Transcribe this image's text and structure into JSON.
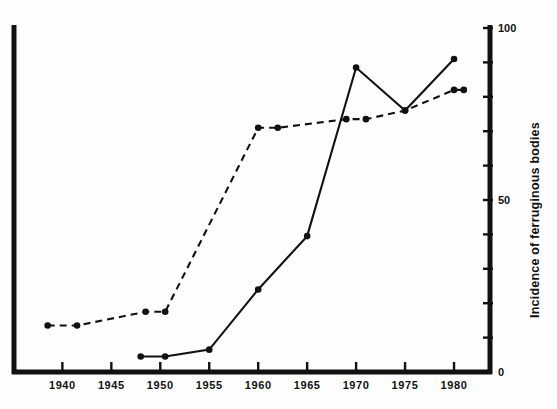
{
  "chart_data": {
    "type": "line",
    "title": "",
    "xlabel": "",
    "ylabel": "Incidence of ferruginous bodies",
    "xlim": [
      1936,
      1982
    ],
    "ylim": [
      0,
      100
    ],
    "xticks": [
      1940,
      1945,
      1950,
      1955,
      1960,
      1965,
      1970,
      1975,
      1980
    ],
    "xtick_labels": [
      "1940",
      "1945",
      "1950",
      "1955",
      "1960",
      "1965",
      "1970",
      "1975",
      "1980"
    ],
    "yticks": [
      0,
      10,
      20,
      30,
      40,
      50,
      60,
      70,
      80,
      90,
      100
    ],
    "ytick_labels_shown": {
      "100": "100",
      "50": "50",
      "0": "0"
    },
    "grid": false,
    "legend": "none",
    "y_axis_position": "right",
    "series": [
      {
        "name": "dashed-series",
        "style": "dashed",
        "marker": "filled-circle",
        "x": [
          1938.5,
          1941.5,
          1948.5,
          1950.5,
          1960,
          1962,
          1969,
          1971,
          1975,
          1980,
          1981
        ],
        "y": [
          13.5,
          13.5,
          17.5,
          17.5,
          71,
          71,
          73.5,
          73.5,
          76,
          82,
          82
        ]
      },
      {
        "name": "solid-series",
        "style": "solid",
        "marker": "filled-circle",
        "x": [
          1948,
          1950.5,
          1955,
          1960,
          1965,
          1970,
          1975,
          1980
        ],
        "y": [
          4.5,
          4.5,
          6.5,
          24,
          39.5,
          88.5,
          76,
          91
        ]
      }
    ]
  }
}
